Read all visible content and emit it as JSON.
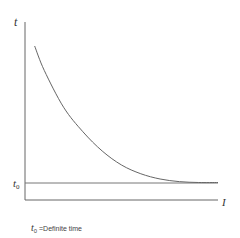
{
  "chart_data": {
    "type": "line",
    "title": "",
    "xlabel": "I",
    "ylabel": "t",
    "asymptote_label": "t0",
    "asymptote_value": 0.1,
    "series": [
      {
        "name": "inverse-time curve",
        "x": [
          0.05,
          0.1,
          0.2,
          0.3,
          0.4,
          0.5,
          0.6,
          0.7,
          0.8,
          0.9,
          1.0
        ],
        "y": [
          0.88,
          0.74,
          0.53,
          0.39,
          0.28,
          0.2,
          0.15,
          0.12,
          0.105,
          0.1,
          0.1
        ]
      }
    ],
    "xlim": [
      0,
      1.0
    ],
    "ylim": [
      0,
      1.0
    ],
    "grid": false
  },
  "labels": {
    "y_axis": "t",
    "x_axis": "I",
    "t0_main": "t",
    "t0_sub": "0",
    "note_sym": "t",
    "note_sub": "0",
    "note_text": "=Definite time"
  }
}
